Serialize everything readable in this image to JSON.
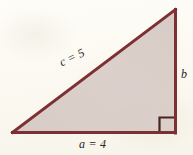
{
  "figure": {
    "kind": "right-triangle-diagram",
    "background_color": "#fdfcf7",
    "stroke_color": "#7d2f33",
    "fill_color": "#d9cdc9",
    "label_color": "#2a2622",
    "labels": {
      "hypotenuse": "c = 5",
      "leg_bottom": "a = 4",
      "leg_right": "b"
    },
    "right_angle_marker": {
      "present": true,
      "corner": "bottom-right"
    },
    "vertices": {
      "bottom_left": [
        13,
        133
      ],
      "bottom_right": [
        175,
        133
      ],
      "top_right": [
        175,
        10
      ]
    },
    "geometry": {
      "hypotenuse_length": 5,
      "leg_bottom_length": 4,
      "leg_right_length": "b",
      "hypotenuse_angle_deg": -25.5
    }
  }
}
